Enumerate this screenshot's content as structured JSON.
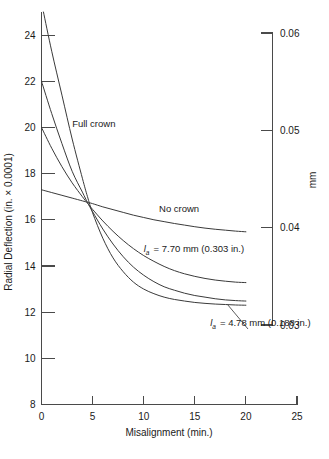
{
  "chart_data": {
    "type": "line",
    "title": "",
    "xlabel": "Misalignment (min.)",
    "ylabel": "Radial Deflection (in. × 0.0001)",
    "y2label": "mm",
    "xlim": [
      0,
      25
    ],
    "ylim": [
      8,
      25
    ],
    "y2lim": [
      0.03,
      0.06
    ],
    "grid": false,
    "legend_position": "inline-annotations",
    "xticks": [
      0,
      5,
      10,
      15,
      20,
      25
    ],
    "xtick_labels": [
      "0",
      "5",
      "10",
      "15",
      "20",
      "25"
    ],
    "yticks": [
      8,
      10,
      12,
      14,
      16,
      18,
      20,
      22,
      24
    ],
    "ytick_labels": [
      "8",
      "10",
      "12",
      "14",
      "16",
      "18",
      "20",
      "22",
      "24"
    ],
    "y2ticks": [
      0.03,
      0.04,
      0.05,
      0.06
    ],
    "y2tick_labels": [
      "0.03",
      "0.04",
      "0.05",
      "0.06"
    ],
    "x": [
      0,
      1,
      2,
      3,
      4,
      4.5,
      5,
      6,
      7,
      8,
      9,
      10,
      11,
      12,
      13,
      14,
      15,
      16,
      17,
      18,
      19,
      20
    ],
    "series": [
      {
        "name": "Full crown",
        "label": "Full crown",
        "values": [
          25.4,
          23.3,
          21.4,
          19.5,
          17.8,
          17.0,
          16.3,
          15.2,
          14.35,
          13.75,
          13.3,
          13.0,
          12.8,
          12.65,
          12.55,
          12.48,
          12.42,
          12.38,
          12.35,
          12.33,
          12.31,
          12.3
        ]
      },
      {
        "name": "la-4.78",
        "label": "= 4.78 mm (0.188 in.)",
        "var_symbol": "l",
        "var_subscript": "a",
        "values": [
          22.0,
          20.6,
          19.3,
          18.1,
          17.2,
          16.75,
          16.35,
          15.6,
          14.95,
          14.4,
          13.95,
          13.6,
          13.32,
          13.1,
          12.95,
          12.82,
          12.72,
          12.65,
          12.58,
          12.53,
          12.5,
          12.48
        ]
      },
      {
        "name": "la-7.70",
        "label": "= 7.70 mm (0.303 in.)",
        "var_symbol": "l",
        "var_subscript": "a",
        "values": [
          20.0,
          19.1,
          18.3,
          17.6,
          17.0,
          16.72,
          16.45,
          15.95,
          15.5,
          15.1,
          14.75,
          14.45,
          14.2,
          13.98,
          13.8,
          13.66,
          13.55,
          13.46,
          13.39,
          13.34,
          13.3,
          13.28
        ]
      },
      {
        "name": "No crown",
        "label": "No crown",
        "values": [
          17.3,
          17.18,
          17.06,
          16.94,
          16.82,
          16.76,
          16.7,
          16.56,
          16.44,
          16.32,
          16.2,
          16.1,
          16.0,
          15.92,
          15.84,
          15.77,
          15.7,
          15.64,
          15.59,
          15.55,
          15.51,
          15.48
        ]
      }
    ],
    "annotations": [
      {
        "text": "Full crown",
        "x": 3.0,
        "y": 20.0
      },
      {
        "text": "No crown",
        "x": 11.5,
        "y": 16.35
      },
      {
        "text": "= 7.70 mm (0.303 in.)",
        "symbol": "l",
        "subscript": "a",
        "x": 10.0,
        "y": 14.6
      },
      {
        "text": "= 4.78 mm (0.188 in.)",
        "symbol": "l",
        "subscript": "a",
        "x": 16.5,
        "y": 11.4
      }
    ],
    "colors": {
      "curve": "#3a3a3a",
      "axis": "#4a4a4a",
      "text": "#1a1a1a",
      "background": "#ffffff"
    }
  },
  "figure": {
    "axis_titles": {
      "x": "Misalignment (min.)",
      "y_left": "Radial Deflection (in. × 0.0001)",
      "y_right": "mm"
    }
  }
}
